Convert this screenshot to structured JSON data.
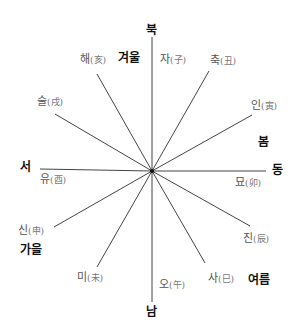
{
  "diagram": {
    "center": {
      "x": 152,
      "y": 171
    },
    "line_color": "#444444",
    "directions": {
      "north": "북",
      "south": "남",
      "west": "서",
      "east": "동"
    },
    "seasons": {
      "winter": "겨울",
      "spring": "봄",
      "summer": "여름",
      "autumn": "가을"
    },
    "branches": [
      {
        "kor": "자",
        "han": "(子)"
      },
      {
        "kor": "축",
        "han": "(丑)"
      },
      {
        "kor": "인",
        "han": "(寅)"
      },
      {
        "kor": "묘",
        "han": "(卯)"
      },
      {
        "kor": "진",
        "han": "(辰)"
      },
      {
        "kor": "사",
        "han": "(巳)"
      },
      {
        "kor": "오",
        "han": "(午)"
      },
      {
        "kor": "미",
        "han": "(未)"
      },
      {
        "kor": "신",
        "han": "(申)"
      },
      {
        "kor": "유",
        "han": "(酉)"
      },
      {
        "kor": "술",
        "han": "(戌)"
      },
      {
        "kor": "해",
        "han": "(亥)"
      }
    ]
  }
}
